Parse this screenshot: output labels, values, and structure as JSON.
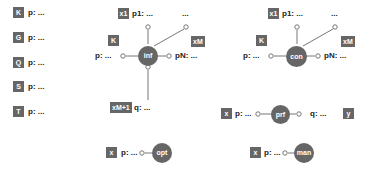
{
  "left_column": {
    "items": [
      {
        "tag": "K",
        "label": "p: ..."
      },
      {
        "tag": "G",
        "label": "p: ..."
      },
      {
        "tag": "Q",
        "label": "p: ..."
      },
      {
        "tag": "S",
        "label": "p: ..."
      },
      {
        "tag": "T",
        "label": "p: ..."
      }
    ]
  },
  "inf": {
    "node": "inf",
    "top_tag": "x1",
    "top_label": "p1: ...",
    "ellipsis": "...",
    "left_tag": "K",
    "left_label": "p: ...",
    "right_tag": "xM",
    "right_label": "pN: ...",
    "bottom_tag": "xM+1",
    "bottom_label": "q: ..."
  },
  "con": {
    "node": "con",
    "top_tag": "x1",
    "top_label": "p1: ...",
    "ellipsis": "...",
    "left_tag": "K",
    "left_label": "p: ...",
    "right_tag": "xM",
    "right_label": "pN: ..."
  },
  "prf": {
    "node": "prf",
    "left_tag": "x",
    "left_label": "p: ...",
    "right_label": "q: ...",
    "right_tag": "y"
  },
  "opt": {
    "node": "opt",
    "left_tag": "x",
    "left_label": "p: ..."
  },
  "man": {
    "node": "man",
    "left_tag": "x",
    "left_label": "p: ..."
  },
  "colors": {
    "node_fill": "#666666",
    "tag_fill": "#666666",
    "wire": "#777777",
    "text": "#222222"
  }
}
